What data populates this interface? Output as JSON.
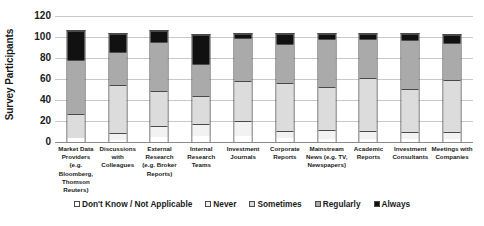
{
  "chart_data": {
    "type": "bar",
    "subtype": "stacked-vertical",
    "title": "",
    "xlabel": "",
    "ylabel": "Survey Participants",
    "ylim": [
      0,
      120
    ],
    "yticks": [
      0,
      20,
      40,
      60,
      80,
      100,
      120
    ],
    "grid": true,
    "legend_position": "bottom",
    "categories": [
      "Market Data Providers (e.g. Bloomberg, Thomson Reuters)",
      "Discussions with Colleagues",
      "External Research (e.g. Broker Reports)",
      "Internal Research Teams",
      "Investment Journals",
      "Corporate Reports",
      "Mainstream News (e.g. TV, Newspapers)",
      "Academic Reports",
      "Investment Consultants",
      "Meetings with Companies"
    ],
    "series": [
      {
        "name": "Don't Know / Not Applicable",
        "color": "#ffffff",
        "values": [
          4,
          2,
          5,
          6,
          6,
          4,
          3,
          3,
          3,
          3
        ]
      },
      {
        "name": "Never",
        "color": "#f2f2f2",
        "values": [
          0,
          7,
          10,
          11,
          14,
          7,
          9,
          8,
          7,
          7
        ]
      },
      {
        "name": "Sometimes",
        "color": "#dcdcdc",
        "values": [
          23,
          46,
          34,
          27,
          39,
          46,
          41,
          51,
          41,
          50
        ]
      },
      {
        "name": "Regularly",
        "color": "#aaaaaa",
        "values": [
          52,
          32,
          47,
          31,
          41,
          37,
          46,
          37,
          47,
          35
        ]
      },
      {
        "name": "Always",
        "color": "#111111",
        "values": [
          28,
          17,
          11,
          28,
          4,
          10,
          5,
          5,
          6,
          8
        ]
      }
    ],
    "totals": [
      107,
      104,
      107,
      103,
      104,
      104,
      104,
      104,
      104,
      103
    ]
  }
}
